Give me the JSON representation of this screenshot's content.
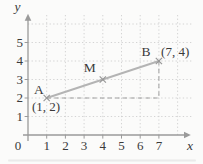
{
  "figure": {
    "background": "#fbfbfa"
  },
  "chart_data": {
    "type": "scatter",
    "title": "",
    "xlabel": "x",
    "ylabel": "y",
    "origin_label": "0",
    "x_ticks": [
      1,
      2,
      3,
      4,
      5,
      6,
      7
    ],
    "y_ticks": [
      1,
      2,
      3,
      4,
      5
    ],
    "xlim": [
      0,
      8.8
    ],
    "ylim": [
      0,
      6.5
    ],
    "grid": "dotted",
    "points": [
      {
        "id": "A",
        "x": 1,
        "y": 2,
        "label": "A",
        "coord_label": "(1, 2)"
      },
      {
        "id": "M",
        "x": 4,
        "y": 3,
        "label": "M",
        "coord_label": ""
      },
      {
        "id": "B",
        "x": 7,
        "y": 4,
        "label": "B",
        "coord_label": "(7, 4)"
      }
    ],
    "segment": {
      "from": [
        1,
        2
      ],
      "to": [
        7,
        4
      ]
    },
    "dashed_guides": [
      {
        "from": [
          1,
          2
        ],
        "to": [
          7,
          2
        ]
      },
      {
        "from": [
          7,
          4
        ],
        "to": [
          7,
          2
        ]
      }
    ],
    "colors": {
      "axis": "#9a9a9a",
      "grid_dots": "#cfcfcf",
      "segment": "#b4b4b4",
      "marker": "#979797",
      "dashed_guide": "#9e9e9e",
      "text": "#3a3a3a",
      "background": "#fbfbfa"
    }
  }
}
